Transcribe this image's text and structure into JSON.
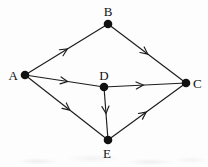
{
  "diagram": {
    "type": "directed-graph",
    "background_color": "#fdfdfd",
    "stroke_color": "#1c1c1c",
    "node_fill_color": "#111111",
    "label_color": "#111111",
    "node_radius": 4.3,
    "line_width": 1.15,
    "arrow_length": 8,
    "arrow_half_angle_deg": 26,
    "label_font_size": 13,
    "nodes": [
      {
        "id": "A",
        "label": "A",
        "x": 25,
        "y": 75,
        "label_x": 18,
        "label_y": 80,
        "label_anchor": "end"
      },
      {
        "id": "B",
        "label": "B",
        "x": 108,
        "y": 24,
        "label_x": 108,
        "label_y": 16,
        "label_anchor": "middle"
      },
      {
        "id": "C",
        "label": "C",
        "x": 186,
        "y": 83,
        "label_x": 193,
        "label_y": 88,
        "label_anchor": "start"
      },
      {
        "id": "D",
        "label": "D",
        "x": 104,
        "y": 87,
        "label_x": 104,
        "label_y": 80,
        "label_anchor": "middle"
      },
      {
        "id": "E",
        "label": "E",
        "x": 108,
        "y": 140,
        "label_x": 107,
        "label_y": 158,
        "label_anchor": "middle"
      }
    ],
    "edges": [
      {
        "from": "A",
        "to": "B",
        "arrow_t": 0.51
      },
      {
        "from": "B",
        "to": "C",
        "arrow_t": 0.51
      },
      {
        "from": "A",
        "to": "D",
        "arrow_t": 0.54
      },
      {
        "from": "D",
        "to": "C",
        "arrow_t": 0.48
      },
      {
        "from": "A",
        "to": "E",
        "arrow_t": 0.54
      },
      {
        "from": "D",
        "to": "E",
        "arrow_t": 0.5
      },
      {
        "from": "E",
        "to": "C",
        "arrow_t": 0.49
      }
    ]
  }
}
